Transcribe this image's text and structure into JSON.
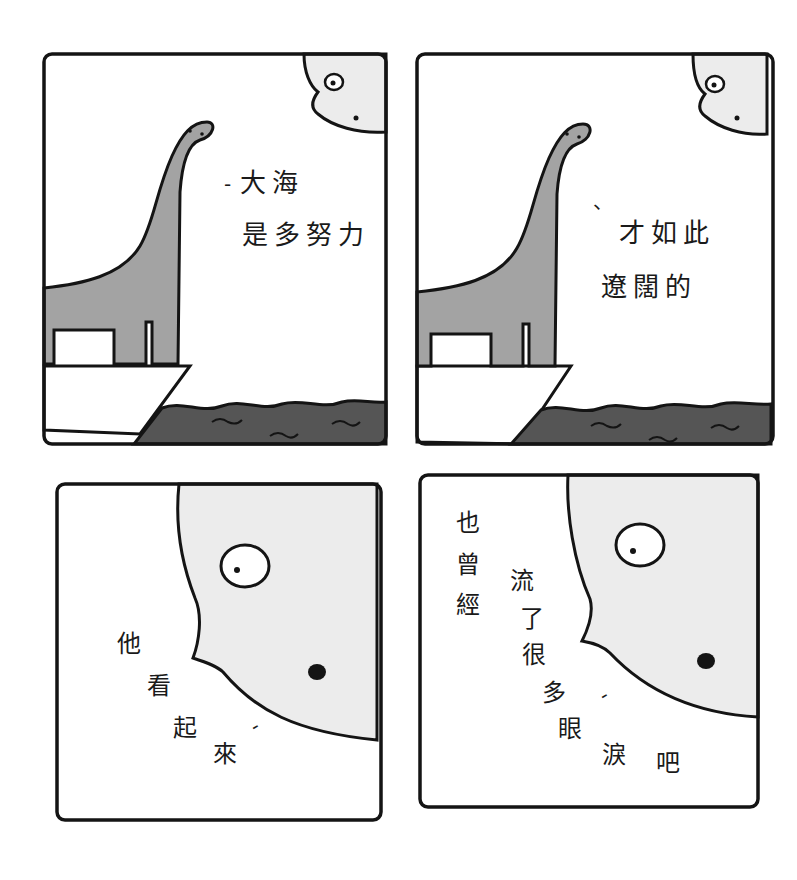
{
  "comic": {
    "panels": [
      {
        "id": 1,
        "position": "top-left",
        "scene": "dinosaur on cliff looking at sea with moon",
        "dialogue_lines": [
          "大海",
          "是多努力"
        ],
        "speech_dash": "-"
      },
      {
        "id": 2,
        "position": "top-right",
        "scene": "dinosaur on cliff looking at sea with moon",
        "dialogue_lines": [
          "才如此",
          "遼闊的"
        ],
        "speech_dash": "、"
      },
      {
        "id": 3,
        "position": "bottom-left",
        "scene": "close-up of moon face",
        "dialogue_chars": [
          "他",
          "看",
          "起",
          "來"
        ],
        "speech_dash": "-"
      },
      {
        "id": 4,
        "position": "bottom-right",
        "scene": "close-up of moon face",
        "dialogue_col1": [
          "也",
          "曾",
          "經"
        ],
        "dialogue_col2": [
          "流",
          "了",
          "很",
          "多",
          "眼",
          "淚",
          "吧"
        ],
        "speech_dash": "-"
      }
    ],
    "colors": {
      "outline": "#141414",
      "dinosaur": "#a3a3a3",
      "sea": "#555555",
      "moon": "#ececec",
      "background": "#ffffff"
    }
  }
}
